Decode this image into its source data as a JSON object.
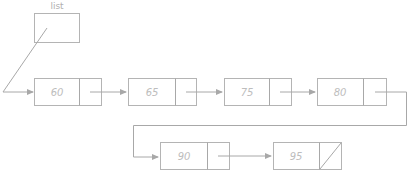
{
  "diagram": {
    "type": "singly-linked-list",
    "head_pointer": {
      "label": "list"
    },
    "nodes": [
      {
        "value": "60",
        "next": "65"
      },
      {
        "value": "65",
        "next": "75"
      },
      {
        "value": "75",
        "next": "80"
      },
      {
        "value": "80",
        "next": "90"
      },
      {
        "value": "90",
        "next": "95"
      },
      {
        "value": "95",
        "next": null
      }
    ],
    "colors": {
      "stroke": "#b4b4b4",
      "arrow": "#a8a8a8",
      "text": "#bdbdbd"
    }
  }
}
